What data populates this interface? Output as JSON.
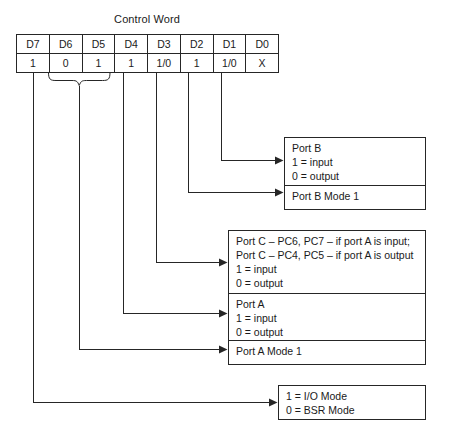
{
  "diagram": {
    "title": "Control Word",
    "table": {
      "bit_labels": [
        "D7",
        "D6",
        "D5",
        "D4",
        "D3",
        "D2",
        "D1",
        "D0"
      ],
      "bit_values": [
        "1",
        "0",
        "1",
        "1",
        "1/0",
        "1",
        "1/0",
        "X"
      ]
    },
    "boxes": {
      "port_b": {
        "title": "Port B",
        "input_line": "1 = input",
        "output_line": "0 = output",
        "mode_line": "Port B Mode 1"
      },
      "port_c_a": {
        "port_c_line1": "Port C – PC6, PC7 – if port A is input;",
        "port_c_line2": "Port C – PC4, PC5 – if port A is output",
        "port_c_input": "1 = input",
        "port_c_output": "0 = output",
        "port_a_title": "Port A",
        "port_a_input": "1 = input",
        "port_a_output": "0 = output",
        "port_a_mode": "Port A Mode 1"
      },
      "mode_select": {
        "io_mode_line": "1 = I/O Mode",
        "bsr_mode_line": "0 = BSR Mode"
      }
    },
    "colors": {
      "line": "#262626",
      "background": "#ffffff",
      "text": "#1a1a1a"
    }
  }
}
